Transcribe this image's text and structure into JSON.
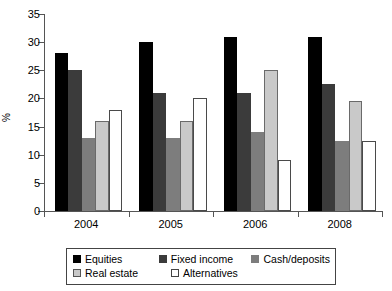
{
  "chart_data": {
    "type": "bar",
    "title": "",
    "xlabel": "",
    "ylabel": "%",
    "categories": [
      "2004",
      "2005",
      "2006",
      "2008"
    ],
    "ylim": [
      0,
      35
    ],
    "yticks": [
      0,
      5,
      10,
      15,
      20,
      25,
      30,
      35
    ],
    "grid": false,
    "legend_position": "bottom",
    "series": [
      {
        "name": "Equities",
        "color": "#000000",
        "values": [
          28,
          30,
          31,
          31
        ]
      },
      {
        "name": "Fixed income",
        "color": "#3b3b3b",
        "values": [
          25,
          21,
          21,
          22.5
        ]
      },
      {
        "name": "Cash/deposits",
        "color": "#7d7d7d",
        "values": [
          13,
          13,
          14,
          12.5
        ]
      },
      {
        "name": "Real estate",
        "color": "#c9c9c9",
        "values": [
          16,
          16,
          25,
          19.5
        ]
      },
      {
        "name": "Alternatives",
        "color": "#ffffff",
        "values": [
          18,
          20,
          9,
          12.5
        ]
      }
    ]
  }
}
